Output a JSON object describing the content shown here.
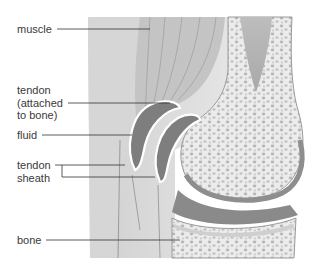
{
  "diagram": {
    "type": "anatomical-illustration",
    "labels": [
      {
        "id": "muscle",
        "text": "muscle"
      },
      {
        "id": "tendon_attached",
        "text": "tendon\n(attached\nto bone)"
      },
      {
        "id": "fluid",
        "text": "fluid"
      },
      {
        "id": "tendon_sheath",
        "text": "tendon\nsheath"
      },
      {
        "id": "bone",
        "text": "bone"
      }
    ]
  },
  "colors": {
    "background": "#ffffff",
    "label_text": "#3a3a3a",
    "leader_line": "#333333",
    "soft_tissue": "#dcdcdc",
    "muscle": "#c8c8c8",
    "fluid": "#8c8c8c",
    "sheath_outline": "#ffffff",
    "bone": "#e8e8e8",
    "cartilage": "#9a9a9a",
    "marrow": "#b5b5b5"
  }
}
